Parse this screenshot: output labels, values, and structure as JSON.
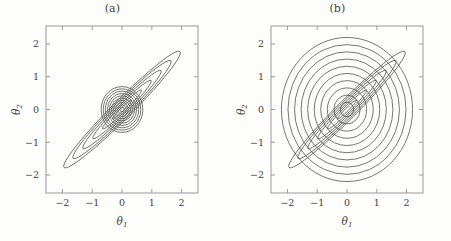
{
  "figure": {
    "background": "#fdfdfc",
    "line_color": "#4a4a4a",
    "frame_color": "#9a9a9a"
  },
  "panels": [
    {
      "id": "a",
      "title": "(a)",
      "xlabel": "θ",
      "xlabel_sub": "1",
      "ylabel": "θ",
      "ylabel_sub": "2",
      "xticks": [
        "−2",
        "−1",
        "0",
        "1",
        "2"
      ],
      "yticks": [
        "−2",
        "−1",
        "0",
        "1",
        "2"
      ],
      "xtick_values": [
        -2,
        -1,
        0,
        1,
        2
      ],
      "ytick_values": [
        -2,
        -1,
        0,
        1,
        2
      ],
      "xlim": [
        -2.55,
        2.55
      ],
      "ylim": [
        -2.55,
        2.55
      ]
    },
    {
      "id": "b",
      "title": "(b)",
      "xlabel": "θ",
      "xlabel_sub": "1",
      "ylabel": "θ",
      "ylabel_sub": "2",
      "xticks": [
        "−2",
        "−1",
        "0",
        "1",
        "2"
      ],
      "yticks": [
        "−2",
        "−1",
        "0",
        "1",
        "2"
      ],
      "xtick_values": [
        -2,
        -1,
        0,
        1,
        2
      ],
      "ytick_values": [
        -2,
        -1,
        0,
        1,
        2
      ],
      "xlim": [
        -2.55,
        2.55
      ],
      "ylim": [
        -2.55,
        2.55
      ]
    }
  ],
  "chart_data": [
    {
      "type": "contour",
      "panel": "a",
      "title": "(a)",
      "xlabel": "theta_1",
      "ylabel": "theta_2",
      "xlim": [
        -2.55,
        2.55
      ],
      "ylim": [
        -2.55,
        2.55
      ],
      "xticks": [
        -2,
        -1,
        0,
        1,
        2
      ],
      "yticks": [
        -2,
        -1,
        0,
        1,
        2
      ],
      "grid": false,
      "legend": "none",
      "families": [
        {
          "name": "correlated-gaussian",
          "shape": "ellipse",
          "center": [
            0.0,
            0.0
          ],
          "rotation_deg": 45,
          "semi_major_axes": [
            0.45,
            0.92,
            1.38,
            1.85,
            2.32,
            2.75
          ],
          "axis_ratio": 0.105,
          "n_contours": 6
        },
        {
          "name": "isotropic-gaussian",
          "shape": "circle",
          "center": [
            0.0,
            0.0
          ],
          "rotation_deg": 0,
          "radii": [
            0.07,
            0.14,
            0.21,
            0.28,
            0.35,
            0.42,
            0.49,
            0.56,
            0.63,
            0.7
          ],
          "axis_ratio": 1.0,
          "n_contours": 10
        }
      ]
    },
    {
      "type": "contour",
      "panel": "b",
      "title": "(b)",
      "xlabel": "theta_1",
      "ylabel": "theta_2",
      "xlim": [
        -2.55,
        2.55
      ],
      "ylim": [
        -2.55,
        2.55
      ],
      "xticks": [
        -2,
        -1,
        0,
        1,
        2
      ],
      "yticks": [
        -2,
        -1,
        0,
        1,
        2
      ],
      "grid": false,
      "legend": "none",
      "families": [
        {
          "name": "correlated-gaussian",
          "shape": "ellipse",
          "center": [
            0.0,
            0.0
          ],
          "rotation_deg": 45,
          "semi_major_axes": [
            0.45,
            0.92,
            1.38,
            1.85,
            2.32,
            2.75
          ],
          "axis_ratio": 0.105,
          "n_contours": 6
        },
        {
          "name": "isotropic-gaussian",
          "shape": "circle",
          "center": [
            0.0,
            0.0
          ],
          "rotation_deg": 0,
          "radii": [
            0.22,
            0.44,
            0.66,
            0.88,
            1.1,
            1.32,
            1.54,
            1.76,
            1.98,
            2.2
          ],
          "axis_ratio": 1.0,
          "n_contours": 10
        }
      ]
    }
  ]
}
